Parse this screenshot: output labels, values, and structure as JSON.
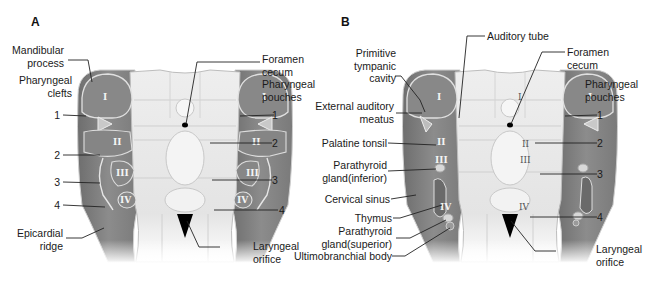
{
  "panels": [
    {
      "id": "A",
      "letter": "A",
      "labels_left": [
        "Mandibular\nprocess",
        "Pharyngeal\nclefts",
        "1",
        "2",
        "3",
        "4",
        "Epicardial\nridge"
      ],
      "labels_right": [
        "Foramen\ncecum",
        "Pharyngeal\npouches",
        "1",
        "2",
        "3",
        "4",
        "Laryngeal\norifice"
      ],
      "arch_numerals": [
        "I",
        "II",
        "III",
        "IV"
      ]
    },
    {
      "id": "B",
      "letter": "B",
      "labels_left": [
        "Primitive\ntympanic\ncavity",
        "External auditory\nmeatus",
        "Palatine tonsil",
        "Parathyroid\ngland(inferior)",
        "Cervical sinus",
        "Thymus",
        "Parathyroid\ngland(superior)",
        "Ultimobranchial body"
      ],
      "labels_top": [
        "Auditory tube"
      ],
      "labels_right": [
        "Foramen\ncecum",
        "Pharyngeal\npouches",
        "1",
        "2",
        "3",
        "4",
        "Laryngeal\norifice"
      ],
      "arch_numerals": [
        "I",
        "II",
        "III",
        "IV"
      ]
    }
  ],
  "colors": {
    "arch_fill": "#8a8a8a",
    "arch_outline": "#d8d8d8",
    "floor_fill": "#e6e6e6",
    "midline_fill": "#f2f2f2",
    "leader_line": "#222222"
  }
}
